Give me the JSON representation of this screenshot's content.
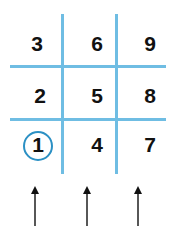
{
  "grid": {
    "rows": [
      [
        "3",
        "6",
        "9"
      ],
      [
        "2",
        "5",
        "8"
      ],
      [
        "1",
        "4",
        "7"
      ]
    ],
    "circled": "1"
  },
  "colors": {
    "grid_line": "#6fbde3",
    "circle": "#2b90c4",
    "text": "#111111"
  },
  "arrows": [
    "up-arrow",
    "up-arrow",
    "up-arrow"
  ]
}
